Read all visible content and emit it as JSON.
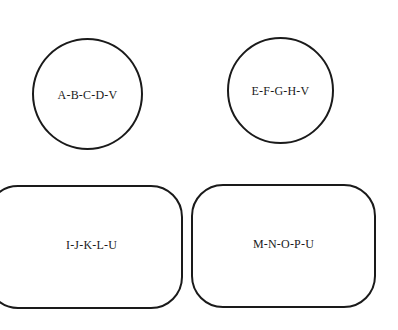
{
  "diagram": {
    "shapes": [
      {
        "id": "circle-1",
        "type": "circle",
        "label": "A-B-C-D-V"
      },
      {
        "id": "circle-2",
        "type": "circle",
        "label": "E-F-G-H-V"
      },
      {
        "id": "rounded-rect-1",
        "type": "rounded-rectangle",
        "label": "I-J-K-L-U"
      },
      {
        "id": "rounded-rect-2",
        "type": "rounded-rectangle",
        "label": "M-N-O-P-U"
      }
    ],
    "stroke_color": "#1a1a1a",
    "background_color": "#ffffff"
  }
}
